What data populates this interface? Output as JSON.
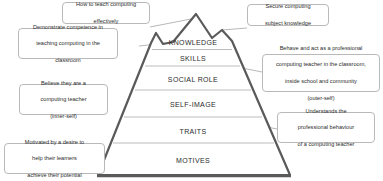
{
  "diagram": {
    "type": "pyramid-diagram",
    "outline_color": "#4a4a4a",
    "divider_color": "#b0b0b0",
    "callout_border_color": "#b9b9b9",
    "background": "#ffffff",
    "tiers": [
      {
        "id": "knowledge",
        "label": "KNOWLEDGE"
      },
      {
        "id": "skills",
        "label": "SKILLS"
      },
      {
        "id": "social-role",
        "label": "SOCIAL ROLE"
      },
      {
        "id": "self-image",
        "label": "SELF-IMAGE"
      },
      {
        "id": "traits",
        "label": "TRAITS"
      },
      {
        "id": "motives",
        "label": "MOTIVES"
      }
    ],
    "callouts": [
      {
        "id": "how-to-teach",
        "lines": [
          "How to teach computing",
          "effectively"
        ],
        "points_to": "knowledge"
      },
      {
        "id": "secure-knowledge",
        "lines": [
          "Secure computing",
          "subject knowledge"
        ],
        "points_to": "knowledge"
      },
      {
        "id": "demonstrate-competence",
        "lines": [
          "Demonstrate competence in",
          "teaching computing in the",
          "classroom"
        ],
        "points_to": "skills"
      },
      {
        "id": "behave-professional",
        "lines": [
          "Behave and act as a professional",
          "computing teacher in the classroom,",
          "inside school and community",
          "(outer-self)"
        ],
        "points_to": "social-role"
      },
      {
        "id": "believe-teacher",
        "lines": [
          "Believe they are a",
          "computing teacher",
          "(inner-self)"
        ],
        "points_to": "self-image"
      },
      {
        "id": "understands-behaviour",
        "lines": [
          "Understands the",
          "professional behaviour",
          "of a computing teacher"
        ],
        "points_to": "traits"
      },
      {
        "id": "motivated-desire",
        "lines": [
          "Motivated by a desire to",
          "help their learners",
          "achieve  their potential"
        ],
        "points_to": "motives"
      }
    ]
  }
}
